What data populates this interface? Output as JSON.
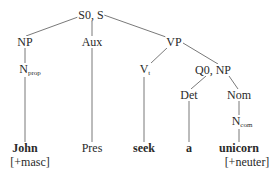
{
  "diagram": {
    "type": "syntax-tree",
    "nodes": {
      "root": "S0, S",
      "np": "NP",
      "aux": "Aux",
      "vp": "VP",
      "nprop": {
        "base": "N",
        "sub": "prop"
      },
      "vt": {
        "base": "V",
        "sub": "t"
      },
      "q0np": "Q0, NP",
      "det": "Det",
      "nom": "Nom",
      "ncom": {
        "base": "N",
        "sub": "com"
      }
    },
    "leaves": {
      "john": "John",
      "pres": "Pres",
      "seek": "seek",
      "a": "a",
      "unicorn": "unicorn"
    },
    "features": {
      "john": "[+masc]",
      "unicorn": "[+neuter]"
    },
    "edges": [
      [
        "S0, S",
        "NP"
      ],
      [
        "S0, S",
        "Aux"
      ],
      [
        "S0, S",
        "VP"
      ],
      [
        "NP",
        "N_prop"
      ],
      [
        "N_prop",
        "John"
      ],
      [
        "Aux",
        "Pres"
      ],
      [
        "VP",
        "V_t"
      ],
      [
        "VP",
        "Q0, NP"
      ],
      [
        "V_t",
        "seek"
      ],
      [
        "Q0, NP",
        "Det"
      ],
      [
        "Q0, NP",
        "Nom"
      ],
      [
        "Det",
        "a"
      ],
      [
        "Nom",
        "N_com"
      ],
      [
        "N_com",
        "unicorn"
      ]
    ]
  }
}
